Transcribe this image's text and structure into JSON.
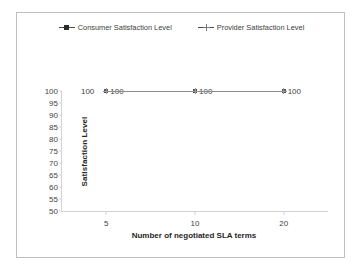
{
  "chart_data": {
    "type": "line",
    "title": "",
    "xlabel": "Number of negotiated SLA terms",
    "ylabel": "Satisfaction Level",
    "categories": [
      "5",
      "10",
      "20"
    ],
    "series": [
      {
        "name": "Consumer Satisfaction Level",
        "marker": "filled-square",
        "color": "#595959",
        "values": [
          100,
          100,
          100
        ],
        "data_labels": [
          "100",
          "100",
          "100"
        ]
      },
      {
        "name": "Provider Satisfaction Level",
        "marker": "cross",
        "color": "#9a9a9a",
        "values": [
          100,
          100,
          100
        ],
        "data_labels": [
          "100",
          "100",
          "100"
        ]
      }
    ],
    "ylim": [
      50,
      100
    ],
    "y_ticks": [
      "100",
      "95",
      "90",
      "85",
      "80",
      "75",
      "70",
      "65",
      "60",
      "55",
      "50"
    ],
    "x_ticks": [
      "5",
      "10",
      "20"
    ],
    "grid": false,
    "legend_position": "top",
    "extra_labels": [
      {
        "text": "100",
        "near": "first-point-left"
      }
    ]
  },
  "legend": {
    "entries": [
      {
        "label": "Consumer Satisfaction Level",
        "marker": "filled-square"
      },
      {
        "label": "Provider Satisfaction Level",
        "marker": "cross"
      }
    ]
  },
  "axes": {
    "y_title": "Satisfaction Level",
    "x_title": "Number of negotiated SLA terms"
  }
}
